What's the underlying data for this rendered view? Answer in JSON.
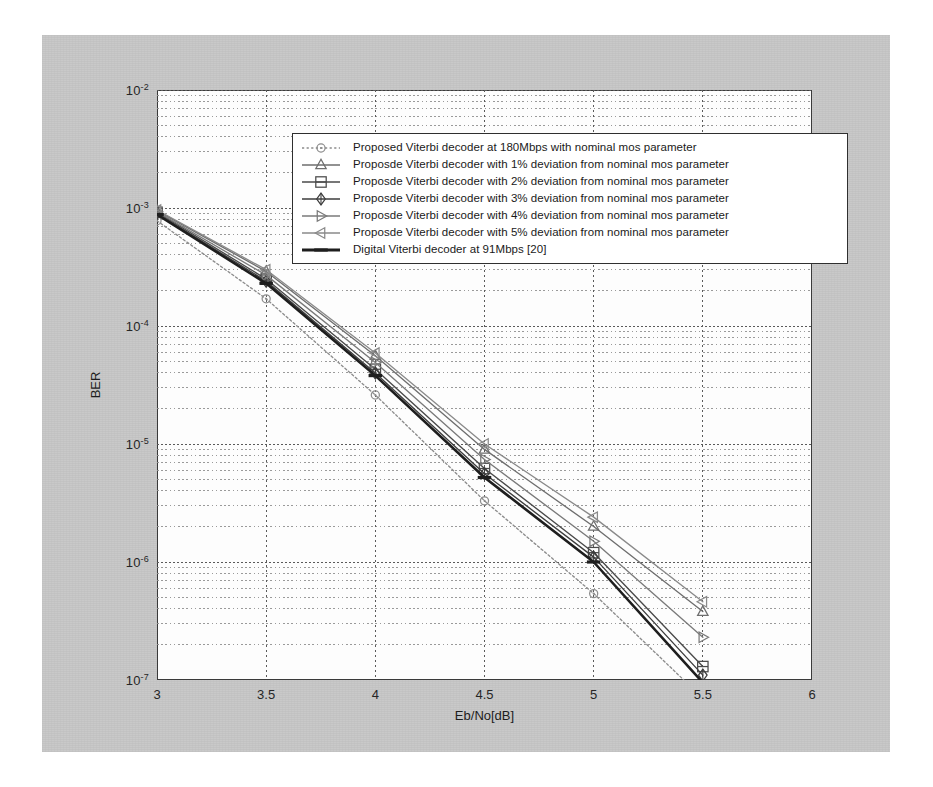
{
  "figure": {
    "background_color": "#c9c9c9",
    "plot_background_color": "#fdfdfd",
    "axis_color": "#3a3a3a"
  },
  "axes": {
    "xlabel": "Eb/No[dB]",
    "ylabel": "BER",
    "xticks": [
      "3",
      "3.5",
      "4",
      "4.5",
      "5",
      "5.5",
      "6"
    ],
    "yticks": [
      "10",
      "10",
      "10",
      "10",
      "10",
      "10"
    ],
    "yexponents": [
      "-2",
      "-3",
      "-4",
      "-5",
      "-6",
      "-7"
    ]
  },
  "chart_data": {
    "type": "line",
    "title": "",
    "xlabel": "Eb/No[dB]",
    "ylabel": "BER",
    "xlim": [
      3,
      6
    ],
    "ylim": [
      1e-07,
      0.01
    ],
    "yscale": "log",
    "xscale": "linear",
    "grid": true,
    "grid_style": "dotted",
    "legend_position": "upper right",
    "x": [
      3,
      3.5,
      4,
      4.5,
      5,
      5.5
    ],
    "series": [
      {
        "name": "Proposed Viterbi decoder at 180Mbps with nominal mos parameter",
        "marker": "circle",
        "linestyle": "dotted",
        "color": "#8c8c8c",
        "values": [
          0.00078,
          0.00017,
          2.6e-05,
          3.3e-06,
          5.4e-07,
          7e-08
        ]
      },
      {
        "name": "Proposde Viterbi decoder with 1% deviation from nominal mos parameter",
        "marker": "triangle-up",
        "linestyle": "solid",
        "color": "#6e6e6e",
        "values": [
          0.00095,
          0.00029,
          5.6e-05,
          9e-06,
          2e-06,
          3.8e-07
        ]
      },
      {
        "name": "Proposde Viterbi decoder with 2% deviation from nominal mos parameter",
        "marker": "square",
        "linestyle": "solid",
        "color": "#4a4a4a",
        "values": [
          0.00092,
          0.00025,
          4.3e-05,
          6.2e-06,
          1.2e-06,
          1.3e-07
        ]
      },
      {
        "name": "Proposde Viterbi decoder with 3% deviation from nominal mos parameter",
        "marker": "diamond",
        "linestyle": "solid",
        "color": "#3d3d3d",
        "values": [
          0.0009,
          0.00024,
          4e-05,
          5.6e-06,
          1.1e-06,
          1.1e-07
        ]
      },
      {
        "name": "Proposde Viterbi decoder with 4% deviation from nominal mos parameter",
        "marker": "triangle-right",
        "linestyle": "solid",
        "color": "#7a7a7a",
        "values": [
          0.00093,
          0.00027,
          4.9e-05,
          7.4e-06,
          1.5e-06,
          2.3e-07
        ]
      },
      {
        "name": "Proposde Viterbi decoder with 5% deviation from nominal mos parameter",
        "marker": "triangle-left",
        "linestyle": "solid",
        "color": "#8a8a8a",
        "values": [
          0.00096,
          0.0003,
          5.9e-05,
          1e-05,
          2.4e-06,
          4.6e-07
        ]
      },
      {
        "name": "Digital Viterbi decoder at 91Mbps [20]",
        "marker": "line-thick",
        "linestyle": "solid",
        "color": "#1e1e1e",
        "values": [
          0.00088,
          0.00023,
          3.8e-05,
          5.2e-06,
          1e-06,
          9.5e-08
        ]
      }
    ]
  },
  "legend": {
    "items": [
      {
        "label": "Proposed Viterbi decoder at 180Mbps with nominal mos parameter"
      },
      {
        "label": "Proposde Viterbi decoder with 1% deviation from nominal mos parameter"
      },
      {
        "label": "Proposde Viterbi decoder with 2% deviation from nominal mos parameter"
      },
      {
        "label": "Proposde Viterbi decoder with 3% deviation from nominal mos parameter"
      },
      {
        "label": "Proposde Viterbi decoder with 4% deviation from nominal mos parameter"
      },
      {
        "label": "Proposde Viterbi decoder with 5% deviation from nominal mos parameter"
      },
      {
        "label": "Digital Viterbi decoder at 91Mbps [20]"
      }
    ]
  }
}
